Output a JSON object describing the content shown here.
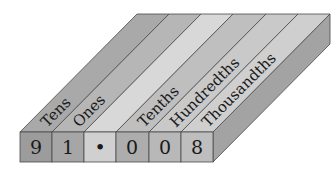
{
  "diagram": {
    "number": "91.008",
    "columns": [
      {
        "label": "Tens",
        "digit": "9",
        "top_color": "#a8a8a8",
        "front_color": "#9a9a9a"
      },
      {
        "label": "Ones",
        "digit": "1",
        "top_color": "#b4b4b4",
        "front_color": "#a4a4a4"
      },
      {
        "label": "",
        "digit": "•",
        "top_color": "#d6d6d6",
        "front_color": "#cfcfcf"
      },
      {
        "label": "Tenths",
        "digit": "0",
        "top_color": "#bdbdbd",
        "front_color": "#acacac"
      },
      {
        "label": "Hundredths",
        "digit": "0",
        "top_color": "#c6c6c6",
        "front_color": "#b6b6b6"
      },
      {
        "label": "Thousandths",
        "digit": "8",
        "top_color": "#cccccc",
        "front_color": "#bcbcbc"
      }
    ],
    "side_color": "#a0a0a0",
    "edge_color": "#4a4a4a"
  }
}
